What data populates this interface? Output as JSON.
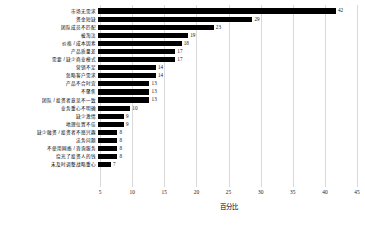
{
  "chart_data": {
    "type": "bar",
    "orientation": "horizontal",
    "title": "",
    "xlabel": "百分比",
    "ylabel": "",
    "xlim": [
      5,
      45
    ],
    "xticks": [
      5,
      10,
      15,
      20,
      25,
      30,
      35,
      40,
      45
    ],
    "grid": true,
    "legend": false,
    "bar_color": "#000000",
    "grid_color": "#d9d9d9",
    "categories": [
      "市场无需求",
      "资金短缺",
      "团队成员不匹配",
      "被淘汰",
      "价格 / 成本因素",
      "产品质量差",
      "需要 / 缺少商业模式",
      "营销不足",
      "忽略客户需求",
      "产品不合时宜",
      "不聚焦",
      "团队 / 投资者意见不一致",
      "业务重心不明确",
      "缺少激情",
      "地理位置不佳",
      "缺少融资 / 投资者不感兴趣",
      "法务问题",
      "不使用网络 / 咨询服务",
      "烧光了投资人的钱",
      "未及时调整战略重心"
    ],
    "values": [
      42,
      29,
      23,
      19,
      18,
      17,
      17,
      14,
      14,
      13,
      13,
      13,
      10,
      9,
      9,
      8,
      8,
      8,
      8,
      7
    ]
  }
}
